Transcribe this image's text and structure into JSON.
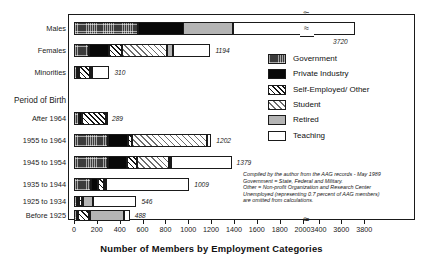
{
  "chart_data": {
    "type": "bar",
    "orientation": "horizontal",
    "stacked": true,
    "title": "",
    "xlabel": "Number of Members by Employment Categories",
    "ylabel": "",
    "group_label": "Period of Birth",
    "xlim": [
      0,
      3800
    ],
    "axis_break": {
      "from": 2000,
      "to": 3400
    },
    "grid": false,
    "legend_position": "right",
    "categories": [
      "Males",
      "Females",
      "Minorities",
      "After 1964",
      "1955 to 1964",
      "1945 to 1954",
      "1935 to 1944",
      "1925 to 1934",
      "Before 1925"
    ],
    "series": [
      {
        "name": "Government",
        "values": [
          560,
          130,
          30,
          40,
          300,
          300,
          150,
          28,
          25
        ]
      },
      {
        "name": "Private Industry",
        "values": [
          430,
          180,
          18,
          30,
          175,
          160,
          62,
          16,
          12
        ]
      },
      {
        "name": "Self-Employed/ Other",
        "values": [
          180,
          110,
          95,
          210,
          30,
          95,
          48,
          22,
          95
        ]
      },
      {
        "name": "Student",
        "values": [
          1040,
          395,
          12,
          9,
          660,
          280,
          16,
          10,
          8
        ]
      },
      {
        "name": "Retired",
        "values": [
          440,
          50,
          5,
          0,
          0,
          18,
          0,
          90,
          300
        ]
      },
      {
        "name": "Teaching",
        "values": [
          1070,
          329,
          150,
          0,
          37,
          526,
          733,
          380,
          48
        ]
      }
    ],
    "totals": [
      3720,
      1194,
      310,
      289,
      1202,
      1379,
      1009,
      546,
      488
    ],
    "total_labels": [
      "3720",
      "1194",
      "310",
      "289",
      "1202",
      "1379",
      "1009",
      "546",
      "488"
    ],
    "xticks": [
      0,
      200,
      400,
      600,
      800,
      1000,
      1200,
      1400,
      1600,
      1800,
      2000,
      3400,
      3600,
      3800
    ],
    "xtick_labels": [
      "0",
      "200",
      "400",
      "600",
      "800",
      "1000",
      "1200",
      "1400",
      "1600",
      "1800",
      "2000",
      "3400",
      "3600",
      "3800"
    ],
    "legend_entries": [
      {
        "label": "Government",
        "pattern": "dark-grid",
        "color": "#3b3b3b"
      },
      {
        "label": "Private Industry",
        "pattern": "solid-black",
        "color": "#080808"
      },
      {
        "label": "Self-Employed/ Other",
        "pattern": "dense-hatch",
        "color": "#ffffff"
      },
      {
        "label": "Student",
        "pattern": "light-hatch",
        "color": "#ffffff"
      },
      {
        "label": "Retired",
        "pattern": "solid-gray",
        "color": "#b4b4b4"
      },
      {
        "label": "Teaching",
        "pattern": "white",
        "color": "#ffffff"
      }
    ],
    "annotations": [
      "Compiled by the author from the AAG records - May 1989",
      "Government = State, Federal and Military.",
      "Other = Non-profit Organization and Research Center",
      "Unemployed (representing 0.7 percent of AAG members)",
      "are omitted from calculations."
    ]
  }
}
